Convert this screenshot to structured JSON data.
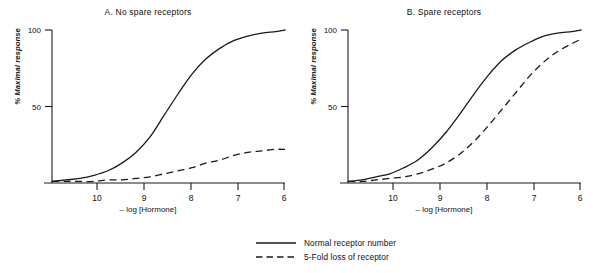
{
  "figure": {
    "background": "#ffffff",
    "line_color": "#1a1a1a",
    "axis_color": "#1a1a1a"
  },
  "panels": [
    {
      "id": "a",
      "title": "A. No spare receptors",
      "ylabel": "% Maximal response",
      "xlabel": "– log [Hormone]"
    },
    {
      "id": "b",
      "title": "B. Spare receptors",
      "ylabel": "% Maximal response",
      "xlabel": "– log [Hormone]"
    }
  ],
  "axes": {
    "y_ticks": [
      "50",
      "100"
    ],
    "x_ticks": [
      "10",
      "9",
      "8",
      "7",
      "6"
    ]
  },
  "legend": {
    "items": [
      {
        "label": "Normal receptor number",
        "style": "solid",
        "icon": "solid-line-icon"
      },
      {
        "label": "5-Fold loss of receptor",
        "style": "dashed",
        "icon": "dashed-line-icon"
      }
    ]
  },
  "chart_data": {
    "type": "line",
    "xlabel": "– log [Hormone]",
    "ylabel": "% Maximal response",
    "xlim": [
      10.7,
      5.7
    ],
    "ylim": [
      0,
      100
    ],
    "x_ticks": [
      10,
      9,
      8,
      7,
      6
    ],
    "y_ticks": [
      50,
      100
    ],
    "x_axis_direction": "decreasing",
    "grid": false,
    "legend_position": "bottom-center",
    "panels": [
      {
        "id": "a",
        "title": "A. No spare receptors",
        "series": [
          {
            "name": "Normal receptor number",
            "style": "solid",
            "ec50_neglog": 8.3,
            "emax": 100,
            "hill": 1.0,
            "x": [
              10.7,
              10.4,
              10.1,
              9.8,
              9.5,
              9.2,
              8.9,
              8.6,
              8.3,
              8.0,
              7.7,
              7.4,
              7.1,
              6.8,
              6.5,
              6.2,
              5.9,
              5.7
            ],
            "y": [
              1,
              2,
              3,
              5,
              8,
              13,
              20,
              30,
              44,
              58,
              71,
              81,
              88,
              93,
              96,
              98,
              99,
              100
            ]
          },
          {
            "name": "5-Fold loss of receptor",
            "style": "dashed",
            "ec50_neglog": 7.6,
            "emax": 22,
            "hill": 1.0,
            "x": [
              10.7,
              10.4,
              10.1,
              9.8,
              9.5,
              9.2,
              8.9,
              8.6,
              8.3,
              8.0,
              7.7,
              7.4,
              7.1,
              6.8,
              6.5,
              6.2,
              5.9,
              5.7
            ],
            "y": [
              1,
              1,
              1,
              1,
              2,
              2,
              3,
              4,
              6,
              8,
              10,
              13,
              15,
              18,
              20,
              21,
              22,
              22
            ]
          }
        ]
      },
      {
        "id": "b",
        "title": "B. Spare receptors",
        "series": [
          {
            "name": "Normal receptor number",
            "style": "solid",
            "ec50_neglog": 8.45,
            "emax": 100,
            "hill": 1.0,
            "x": [
              10.7,
              10.4,
              10.1,
              9.8,
              9.5,
              9.2,
              8.9,
              8.6,
              8.3,
              8.0,
              7.7,
              7.4,
              7.1,
              6.8,
              6.5,
              6.2,
              5.9,
              5.7
            ],
            "y": [
              1,
              2,
              4,
              6,
              10,
              15,
              23,
              33,
              45,
              58,
              70,
              80,
              87,
              92,
              96,
              98,
              99,
              100
            ]
          },
          {
            "name": "5-Fold loss of receptor",
            "style": "dashed",
            "ec50_neglog": 7.6,
            "emax": 100,
            "hill": 1.0,
            "x": [
              10.7,
              10.4,
              10.1,
              9.8,
              9.5,
              9.2,
              8.9,
              8.6,
              8.3,
              8.0,
              7.7,
              7.4,
              7.1,
              6.8,
              6.5,
              6.2,
              5.9,
              5.7
            ],
            "y": [
              1,
              1,
              2,
              3,
              4,
              6,
              9,
              13,
              19,
              27,
              37,
              48,
              59,
              70,
              79,
              86,
              91,
              94
            ]
          }
        ]
      }
    ]
  }
}
